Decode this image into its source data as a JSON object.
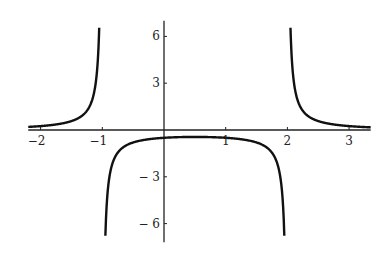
{
  "chart_data": {
    "type": "line",
    "title": "",
    "xlabel": "",
    "ylabel": "",
    "function": "1/((x+1)(x-2))",
    "xlim": [
      -2.2,
      3.35
    ],
    "ylim": [
      -7.2,
      7.0
    ],
    "grid": false,
    "legend": null,
    "x_ticks": [
      -2,
      -1,
      1,
      2,
      3
    ],
    "x_tick_labels": [
      "-2",
      "-1",
      "1",
      "2",
      "3"
    ],
    "y_ticks": [
      6,
      3,
      -3,
      -6
    ],
    "y_tick_labels": [
      "6",
      "3",
      "-3",
      "-6"
    ],
    "vertical_asymptotes": [
      -1,
      2
    ],
    "series": [
      {
        "name": "left branch",
        "x": [
          -2.2,
          -2.0,
          -1.8,
          -1.6,
          -1.4,
          -1.3,
          -1.2,
          -1.15,
          -1.1,
          -1.07,
          -1.05
        ],
        "y": [
          0.19,
          0.25,
          0.33,
          0.46,
          0.74,
          1.01,
          1.52,
          2.05,
          3.23,
          4.6,
          6.4
        ]
      },
      {
        "name": "middle branch",
        "x": [
          -0.95,
          -0.9,
          -0.8,
          -0.6,
          -0.4,
          -0.2,
          0,
          0.5,
          1,
          1.2,
          1.4,
          1.6,
          1.8,
          1.9,
          1.95
        ],
        "y": [
          -6.9,
          -3.45,
          -1.79,
          -0.96,
          -0.69,
          -0.57,
          -0.5,
          -0.44,
          -0.5,
          -0.57,
          -0.69,
          -0.96,
          -1.79,
          -3.45,
          -6.9
        ]
      },
      {
        "name": "right branch",
        "x": [
          2.05,
          2.07,
          2.1,
          2.15,
          2.2,
          2.3,
          2.4,
          2.6,
          2.8,
          3.0,
          3.2,
          3.35
        ],
        "y": [
          6.4,
          4.6,
          3.23,
          2.05,
          1.52,
          1.01,
          0.74,
          0.46,
          0.33,
          0.25,
          0.19,
          0.16
        ]
      }
    ]
  }
}
